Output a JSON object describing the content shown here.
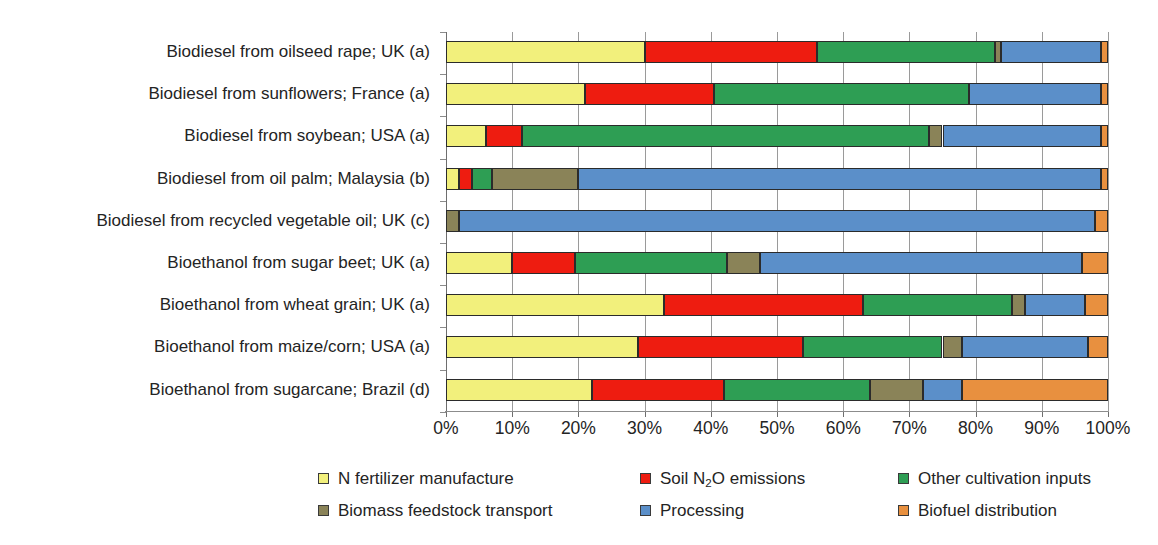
{
  "chart_data": {
    "type": "bar",
    "orientation": "horizontal",
    "stacked": true,
    "normalized_percent": true,
    "title": "",
    "subtitle": "",
    "xlabel": "",
    "ylabel": "",
    "xlim": [
      0,
      100
    ],
    "xticks": [
      "0%",
      "10%",
      "20%",
      "30%",
      "40%",
      "50%",
      "60%",
      "70%",
      "80%",
      "90%",
      "100%"
    ],
    "xtick_values": [
      0,
      10,
      20,
      30,
      40,
      50,
      60,
      70,
      80,
      90,
      100
    ],
    "grid": "vertical",
    "legend_position": "bottom",
    "categories": [
      "Biodiesel from oilseed rape; UK (a)",
      "Biodiesel from sunflowers; France (a)",
      "Biodiesel from soybean; USA (a)",
      "Biodiesel from oil palm; Malaysia (b)",
      "Biodiesel from recycled vegetable oil; UK (c)",
      "Bioethanol from sugar beet; UK (a)",
      "Bioethanol from wheat grain; UK (a)",
      "Bioethanol from maize/corn; USA (a)",
      "Bioethanol from sugarcane; Brazil (d)"
    ],
    "series": [
      {
        "name": "N fertilizer manufacture",
        "color": "#f2f07c",
        "values": [
          30.0,
          21.0,
          6.0,
          2.0,
          0.0,
          10.0,
          33.0,
          29.0,
          22.0
        ]
      },
      {
        "name": "Soil N2O emissions",
        "label_html": "Soil N<sub>2</sub>O emissions",
        "color": "#ee1c10",
        "values": [
          26.0,
          19.5,
          5.5,
          2.0,
          0.0,
          9.5,
          30.0,
          25.0,
          20.0
        ]
      },
      {
        "name": "Other cultivation inputs",
        "color": "#2e9e54",
        "values": [
          27.0,
          38.5,
          61.5,
          3.0,
          0.0,
          23.0,
          22.5,
          21.0,
          22.0
        ]
      },
      {
        "name": "Biomass feedstock transport",
        "color": "#8a8358",
        "values": [
          0.8,
          0.0,
          2.0,
          13.0,
          2.0,
          5.0,
          2.0,
          3.0,
          8.0
        ]
      },
      {
        "name": "Processing",
        "color": "#5b8fc9",
        "values": [
          15.2,
          20.0,
          24.0,
          79.0,
          96.0,
          48.5,
          9.0,
          19.0,
          6.0
        ]
      },
      {
        "name": "Biofuel distribution",
        "color": "#e8903f",
        "values": [
          1.0,
          1.0,
          1.0,
          1.0,
          2.0,
          4.0,
          3.5,
          3.0,
          22.0
        ]
      }
    ]
  },
  "legend": {
    "items": [
      {
        "label": "N fertilizer manufacture",
        "color": "#f2f07c"
      },
      {
        "label": "Soil N2O emissions",
        "color": "#ee1c10"
      },
      {
        "label": "Other cultivation inputs",
        "color": "#2e9e54"
      },
      {
        "label": "Biomass feedstock transport",
        "color": "#8a8358"
      },
      {
        "label": "Processing",
        "color": "#5b8fc9"
      },
      {
        "label": "Biofuel distribution",
        "color": "#e8903f"
      }
    ]
  }
}
